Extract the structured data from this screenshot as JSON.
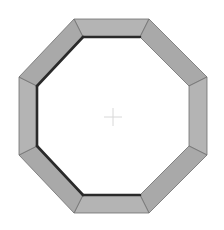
{
  "figure": {
    "shape": "octagon-frame",
    "colors": {
      "background": "#ffffff",
      "segment_fill": "#a9a9a9",
      "segment_fill_light": "#b4b4b4",
      "segment_edge": "#6e6e6e",
      "inner_shadow": "#2a2a2a",
      "crosshair": "#d8d8d8"
    },
    "outer_vertices": [
      [
        74,
        19
      ],
      [
        149,
        19
      ],
      [
        207,
        77
      ],
      [
        207,
        155
      ],
      [
        149,
        213
      ],
      [
        74,
        213
      ],
      [
        19,
        155
      ],
      [
        19,
        77
      ]
    ],
    "inner_vertices": [
      [
        83,
        37
      ],
      [
        140,
        37
      ],
      [
        189,
        86
      ],
      [
        189,
        146
      ],
      [
        140,
        195
      ],
      [
        83,
        195
      ],
      [
        37,
        146
      ],
      [
        37,
        86
      ]
    ],
    "center": [
      113,
      117
    ]
  }
}
